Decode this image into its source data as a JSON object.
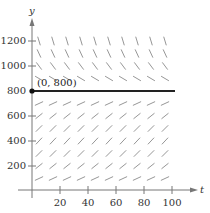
{
  "chart_data": {
    "type": "line",
    "title": "",
    "xlabel": "t",
    "ylabel": "y",
    "xlim": [
      0,
      105
    ],
    "ylim": [
      0,
      1300
    ],
    "x_ticks": [
      20,
      40,
      60,
      80,
      100
    ],
    "y_ticks": [
      200,
      400,
      600,
      800,
      1000,
      1200
    ],
    "grid": false,
    "legend": null,
    "slope_field": {
      "description": "Logistic-type slope field: positive slopes below y=800, negative above, zero at y=800",
      "t_values": [
        5,
        15,
        25,
        35,
        45,
        55,
        65,
        75,
        85,
        95
      ],
      "y_values": [
        100,
        200,
        300,
        400,
        500,
        600,
        700,
        900,
        1000,
        1100,
        1200
      ],
      "equilibrium": 800
    },
    "series": [
      {
        "name": "equilibrium solution",
        "x": [
          0,
          100
        ],
        "y": [
          800,
          800
        ]
      }
    ],
    "annotations": [
      {
        "text": "(0, 800)",
        "x": 0,
        "y": 800,
        "point": true
      }
    ]
  },
  "labels": {
    "x_axis": "t",
    "y_axis": "y",
    "point": "(0, 800)",
    "x_ticks": [
      "20",
      "40",
      "60",
      "80",
      "100"
    ],
    "y_ticks": [
      "200",
      "400",
      "600",
      "800",
      "1000",
      "1200"
    ]
  },
  "colors": {
    "axis": "#777777",
    "slope": "#8a8a8a",
    "solution": "#222222",
    "text": "#333333"
  }
}
